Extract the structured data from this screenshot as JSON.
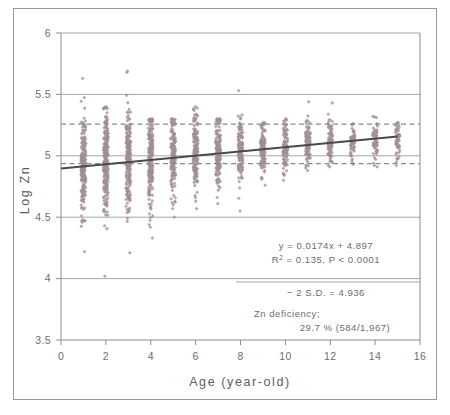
{
  "figure": {
    "background_color": "#ffffff",
    "frame_color": "#9a9a9a",
    "axis_color": "#8d8d8d",
    "gridline_color": "#9d9d9d",
    "marker_color": "#a08f95",
    "trendline_color": "#4a4a4a",
    "dashed_line_color": "#8a8a8a",
    "text_color": "#6e6e6e"
  },
  "chart_data": {
    "type": "scatter",
    "title": "",
    "subtitle": "",
    "xlabel": "Age  (year-old)",
    "ylabel": "Log Zn",
    "xlim": [
      0,
      16
    ],
    "ylim": [
      3.5,
      6
    ],
    "xticks": [
      0,
      2,
      4,
      6,
      8,
      10,
      12,
      14,
      16
    ],
    "xticklabels": [
      "0",
      "2",
      "4",
      "6",
      "8",
      "10",
      "12",
      "14",
      "16"
    ],
    "yticks": [
      3.5,
      4,
      4.5,
      5,
      5.5,
      6
    ],
    "yticklabels": [
      "3.5",
      "4",
      "4.5",
      "5",
      "5.5",
      "6"
    ],
    "grid": "horizontal",
    "legend": "none",
    "marker": "diamond",
    "marker_size": 3,
    "series": [
      {
        "name": "Log Zn by age",
        "description": "Dense vertical columns of individual subject values at each integer age from 1 to 15 years; n = 1,967",
        "n_total": 1967,
        "columns": [
          {
            "age": 1,
            "n": 210,
            "min": 4.22,
            "max": 5.63,
            "q1": 4.72,
            "median": 4.93,
            "q3": 5.13,
            "core_low": 4.47,
            "core_high": 5.26
          },
          {
            "age": 2,
            "n": 250,
            "min": 4.02,
            "max": 5.4,
            "q1": 4.76,
            "median": 4.95,
            "q3": 5.14,
            "core_low": 4.43,
            "core_high": 5.28
          },
          {
            "age": 3,
            "n": 240,
            "min": 4.21,
            "max": 5.69,
            "q1": 4.79,
            "median": 4.98,
            "q3": 5.16,
            "core_low": 4.49,
            "core_high": 5.3
          },
          {
            "age": 4,
            "n": 200,
            "min": 4.33,
            "max": 5.3,
            "q1": 4.82,
            "median": 5.0,
            "q3": 5.17,
            "core_low": 4.44,
            "core_high": 5.29
          },
          {
            "age": 5,
            "n": 165,
            "min": 4.5,
            "max": 5.3,
            "q1": 4.85,
            "median": 5.01,
            "q3": 5.17,
            "core_low": 4.57,
            "core_high": 5.28
          },
          {
            "age": 6,
            "n": 160,
            "min": 4.57,
            "max": 5.4,
            "q1": 4.87,
            "median": 5.02,
            "q3": 5.18,
            "core_low": 4.63,
            "core_high": 5.28
          },
          {
            "age": 7,
            "n": 150,
            "min": 4.61,
            "max": 5.3,
            "q1": 4.89,
            "median": 5.04,
            "q3": 5.19,
            "core_low": 4.66,
            "core_high": 5.3
          },
          {
            "age": 8,
            "n": 130,
            "min": 4.55,
            "max": 5.53,
            "q1": 4.9,
            "median": 5.05,
            "q3": 5.2,
            "core_low": 4.79,
            "core_high": 5.3
          },
          {
            "age": 9,
            "n": 110,
            "min": 4.76,
            "max": 5.27,
            "q1": 4.92,
            "median": 5.06,
            "q3": 5.2,
            "core_low": 4.82,
            "core_high": 5.27
          },
          {
            "age": 10,
            "n": 100,
            "min": 4.8,
            "max": 5.3,
            "q1": 4.94,
            "median": 5.08,
            "q3": 5.21,
            "core_low": 4.84,
            "core_high": 5.3
          },
          {
            "age": 11,
            "n": 90,
            "min": 4.88,
            "max": 5.44,
            "q1": 4.97,
            "median": 5.09,
            "q3": 5.22,
            "core_low": 4.9,
            "core_high": 5.27
          },
          {
            "age": 12,
            "n": 85,
            "min": 4.91,
            "max": 5.43,
            "q1": 4.98,
            "median": 5.1,
            "q3": 5.22,
            "core_low": 4.92,
            "core_high": 5.28
          },
          {
            "age": 13,
            "n": 60,
            "min": 4.93,
            "max": 5.26,
            "q1": 5.0,
            "median": 5.11,
            "q3": 5.22,
            "core_low": 4.96,
            "core_high": 5.26
          },
          {
            "age": 14,
            "n": 58,
            "min": 4.91,
            "max": 5.32,
            "q1": 5.01,
            "median": 5.12,
            "q3": 5.23,
            "core_low": 4.94,
            "core_high": 5.26
          },
          {
            "age": 15,
            "n": 50,
            "min": 4.92,
            "max": 5.27,
            "q1": 5.03,
            "median": 5.13,
            "q3": 5.24,
            "core_low": 4.95,
            "core_high": 5.27
          }
        ]
      }
    ],
    "trendline": {
      "type": "linear",
      "slope": 0.0174,
      "intercept": 4.897,
      "x_start": 0,
      "x_end": 15,
      "y_start": 4.897,
      "y_end": 5.158,
      "r_squared": 0.135,
      "p_value": "< 0.0001"
    },
    "reference_lines": [
      {
        "name": "upper-dashed-reference",
        "y": 5.258,
        "style": "dashed",
        "label": ""
      },
      {
        "name": "lower-dashed-reference-minus-2sd",
        "y": 4.936,
        "style": "dashed",
        "label": "- 2 S.D. = 4.936"
      }
    ],
    "annotations": {
      "equation": "y = 0.0174x + 4.897",
      "r_squared_prefix": "R",
      "r_squared_sup": "2",
      "r_squared_body": " = 0.135,  P < 0.0001",
      "sd_line": "− 2 S.D. = 4.936",
      "deficiency_title": "Zn deficiency;",
      "deficiency_value": "29.7 %  (584/1,967)"
    }
  }
}
